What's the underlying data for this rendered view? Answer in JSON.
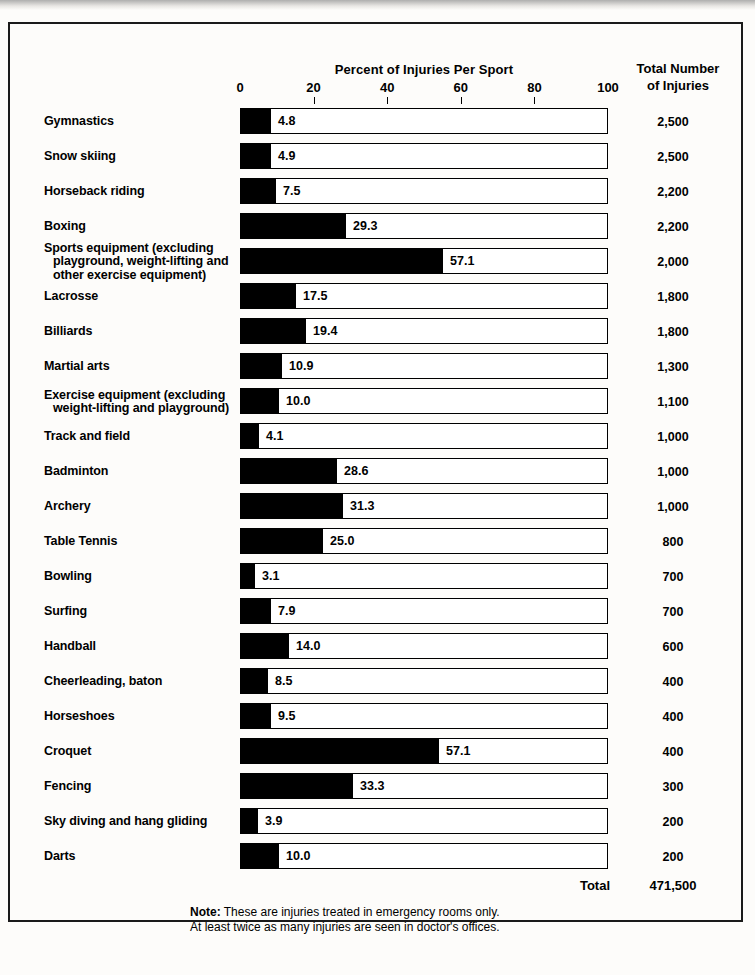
{
  "header": {
    "axis_title": "Percent of Injuries Per Sport",
    "total_header_line1": "Total Number",
    "total_header_line2": "of Injuries"
  },
  "axis": {
    "ticks": [
      "0",
      "20",
      "40",
      "60",
      "80",
      "100"
    ],
    "min": 0,
    "max": 100
  },
  "total_row": {
    "label": "Total",
    "value": "471,500"
  },
  "note": {
    "lead": "Note:",
    "line1": " These are injuries treated in emergency rooms only.",
    "line2": "At least twice as many injuries are seen in doctor's offices."
  },
  "chart_data": {
    "type": "bar",
    "title": "Percent of Injuries Per Sport",
    "xlabel": "Percent of Injuries Per Sport",
    "ylabel": "",
    "xlim": [
      0,
      100
    ],
    "orientation": "horizontal",
    "grid": false,
    "legend": "none",
    "value_column_header": "Total Number of Injuries",
    "categories": [
      "Gymnastics",
      "Snow skiing",
      "Horseback riding",
      "Boxing",
      "Sports equipment (excluding playground, weight-lifting and other exercise equipment)",
      "Lacrosse",
      "Billiards",
      "Martial arts",
      "Exercise equipment (excluding weight-lifting and playground)",
      "Track and field",
      "Badminton",
      "Archery",
      "Table Tennis",
      "Bowling",
      "Surfing",
      "Handball",
      "Cheerleading, baton",
      "Horseshoes",
      "Croquet",
      "Fencing",
      "Sky diving and hang gliding",
      "Darts"
    ],
    "values": [
      4.8,
      4.9,
      7.5,
      29.3,
      57.1,
      17.5,
      19.4,
      10.9,
      10.0,
      4.1,
      28.6,
      31.3,
      25.0,
      3.1,
      7.9,
      14.0,
      8.5,
      9.5,
      57.1,
      33.3,
      3.9,
      10.0
    ],
    "totals": [
      "2,500",
      "2,500",
      "2,200",
      "2,200",
      "2,000",
      "1,800",
      "1,800",
      "1,300",
      "1,100",
      "1,000",
      "1,000",
      "1,000",
      "800",
      "700",
      "700",
      "600",
      "400",
      "400",
      "400",
      "300",
      "200",
      "200"
    ],
    "total_all": "471,500"
  },
  "rows": [
    {
      "label_lines": [
        "Gymnastics"
      ],
      "value": 4.8,
      "value_label": "4.8",
      "bar_px": 30,
      "total": "2,500"
    },
    {
      "label_lines": [
        "Snow skiing"
      ],
      "value": 4.9,
      "value_label": "4.9",
      "bar_px": 30,
      "total": "2,500"
    },
    {
      "label_lines": [
        "Horseback riding"
      ],
      "value": 7.5,
      "value_label": "7.5",
      "bar_px": 35,
      "total": "2,200"
    },
    {
      "label_lines": [
        "Boxing"
      ],
      "value": 29.3,
      "value_label": "29.3",
      "bar_px": 105,
      "total": "2,200"
    },
    {
      "label_lines": [
        "Sports equipment (excluding",
        "playground, weight-lifting and",
        "other exercise equipment)"
      ],
      "value": 57.1,
      "value_label": "57.1",
      "bar_px": 202,
      "total": "2,000"
    },
    {
      "label_lines": [
        "Lacrosse"
      ],
      "value": 17.5,
      "value_label": "17.5",
      "bar_px": 55,
      "total": "1,800"
    },
    {
      "label_lines": [
        "Billiards"
      ],
      "value": 19.4,
      "value_label": "19.4",
      "bar_px": 65,
      "total": "1,800"
    },
    {
      "label_lines": [
        "Martial  arts"
      ],
      "value": 10.9,
      "value_label": "10.9",
      "bar_px": 41,
      "total": "1,300"
    },
    {
      "label_lines": [
        "Exercise equipment (excluding",
        "weight-lifting and playground)"
      ],
      "value": 10.0,
      "value_label": "10.0",
      "bar_px": 38,
      "total": "1,100"
    },
    {
      "label_lines": [
        "Track and field"
      ],
      "value": 4.1,
      "value_label": "4.1",
      "bar_px": 18,
      "total": "1,000"
    },
    {
      "label_lines": [
        "Badminton"
      ],
      "value": 28.6,
      "value_label": "28.6",
      "bar_px": 96,
      "total": "1,000"
    },
    {
      "label_lines": [
        "Archery"
      ],
      "value": 31.3,
      "value_label": "31.3",
      "bar_px": 102,
      "total": "1,000"
    },
    {
      "label_lines": [
        "Table Tennis"
      ],
      "value": 25.0,
      "value_label": "25.0",
      "bar_px": 82,
      "total": "800"
    },
    {
      "label_lines": [
        "Bowling"
      ],
      "value": 3.1,
      "value_label": "3.1",
      "bar_px": 14,
      "total": "700"
    },
    {
      "label_lines": [
        "Surfing"
      ],
      "value": 7.9,
      "value_label": "7.9",
      "bar_px": 30,
      "total": "700"
    },
    {
      "label_lines": [
        "Handball"
      ],
      "value": 14.0,
      "value_label": "14.0",
      "bar_px": 48,
      "total": "600"
    },
    {
      "label_lines": [
        "Cheerleading, baton"
      ],
      "value": 8.5,
      "value_label": "8.5",
      "bar_px": 27,
      "total": "400"
    },
    {
      "label_lines": [
        "Horseshoes"
      ],
      "value": 9.5,
      "value_label": "9.5",
      "bar_px": 30,
      "total": "400"
    },
    {
      "label_lines": [
        "Croquet"
      ],
      "value": 57.1,
      "value_label": "57.1",
      "bar_px": 198,
      "total": "400"
    },
    {
      "label_lines": [
        "Fencing"
      ],
      "value": 33.3,
      "value_label": "33.3",
      "bar_px": 112,
      "total": "300"
    },
    {
      "label_lines": [
        "Sky diving and hang gliding"
      ],
      "value": 3.9,
      "value_label": "3.9",
      "bar_px": 17,
      "total": "200"
    },
    {
      "label_lines": [
        "Darts"
      ],
      "value": 10.0,
      "value_label": "10.0",
      "bar_px": 38,
      "total": "200"
    }
  ]
}
